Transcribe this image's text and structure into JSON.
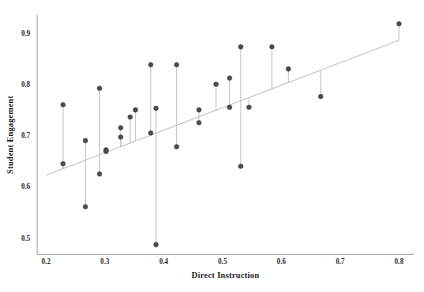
{
  "chart_data": {
    "type": "scatter",
    "title": "",
    "xlabel": "Direct Instruction",
    "ylabel": "Student Engagement",
    "xlim": [
      0.185,
      0.825
    ],
    "ylim": [
      0.468,
      0.935
    ],
    "xticks": [
      0.2,
      0.3,
      0.4,
      0.5,
      0.6,
      0.7,
      0.8
    ],
    "xticklabels": [
      "0.2",
      "0.3",
      "0.4",
      "0.5",
      "0.6",
      "0.7",
      "0.8"
    ],
    "yticks": [
      0.5,
      0.6,
      0.7,
      0.8,
      0.9
    ],
    "yticklabels": [
      "0.5",
      "0.6",
      "0.7",
      "0.8",
      "0.9"
    ],
    "grid": false,
    "legend": null,
    "marker_color": "#4a4a52",
    "fit_line_color": "#c9c9c9",
    "residual_color": "#b9b9b9",
    "fit_line": {
      "type": "linear",
      "x": [
        0.2,
        0.8
      ],
      "y": [
        0.6225,
        0.886
      ],
      "slope": 0.439,
      "intercept": 0.5347
    },
    "x": [
      0.229,
      0.229,
      0.267,
      0.267,
      0.291,
      0.291,
      0.302,
      0.302,
      0.327,
      0.327,
      0.343,
      0.352,
      0.378,
      0.378,
      0.387,
      0.387,
      0.422,
      0.422,
      0.46,
      0.46,
      0.489,
      0.512,
      0.512,
      0.531,
      0.531,
      0.545,
      0.584,
      0.612,
      0.667,
      0.8
    ],
    "y": [
      0.76,
      0.645,
      0.69,
      0.561,
      0.792,
      0.625,
      0.672,
      0.669,
      0.715,
      0.697,
      0.736,
      0.75,
      0.838,
      0.705,
      0.753,
      0.487,
      0.838,
      0.678,
      0.75,
      0.725,
      0.8,
      0.812,
      0.755,
      0.873,
      0.64,
      0.755,
      0.873,
      0.83,
      0.776,
      0.918
    ],
    "points": [
      {
        "x": 0.229,
        "y": 0.76
      },
      {
        "x": 0.229,
        "y": 0.645
      },
      {
        "x": 0.267,
        "y": 0.69
      },
      {
        "x": 0.267,
        "y": 0.561
      },
      {
        "x": 0.291,
        "y": 0.792
      },
      {
        "x": 0.291,
        "y": 0.625
      },
      {
        "x": 0.302,
        "y": 0.672
      },
      {
        "x": 0.302,
        "y": 0.669
      },
      {
        "x": 0.327,
        "y": 0.715
      },
      {
        "x": 0.327,
        "y": 0.697
      },
      {
        "x": 0.343,
        "y": 0.736
      },
      {
        "x": 0.352,
        "y": 0.75
      },
      {
        "x": 0.378,
        "y": 0.838
      },
      {
        "x": 0.378,
        "y": 0.705
      },
      {
        "x": 0.387,
        "y": 0.753
      },
      {
        "x": 0.387,
        "y": 0.487
      },
      {
        "x": 0.422,
        "y": 0.838
      },
      {
        "x": 0.422,
        "y": 0.678
      },
      {
        "x": 0.46,
        "y": 0.75
      },
      {
        "x": 0.46,
        "y": 0.725
      },
      {
        "x": 0.489,
        "y": 0.8
      },
      {
        "x": 0.512,
        "y": 0.812
      },
      {
        "x": 0.512,
        "y": 0.755
      },
      {
        "x": 0.531,
        "y": 0.873
      },
      {
        "x": 0.531,
        "y": 0.64
      },
      {
        "x": 0.545,
        "y": 0.755
      },
      {
        "x": 0.584,
        "y": 0.873
      },
      {
        "x": 0.612,
        "y": 0.83
      },
      {
        "x": 0.667,
        "y": 0.776
      },
      {
        "x": 0.8,
        "y": 0.918
      }
    ]
  }
}
